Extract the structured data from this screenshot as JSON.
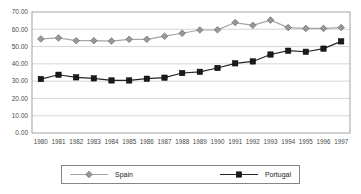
{
  "chart_data": {
    "type": "line",
    "title": "",
    "xlabel": "",
    "ylabel": "",
    "x": [
      "1980",
      "1981",
      "1982",
      "1983",
      "1984",
      "1985",
      "1986",
      "1987",
      "1988",
      "1989",
      "1990",
      "1991",
      "1992",
      "1993",
      "1994",
      "1995",
      "1996",
      "1997"
    ],
    "series": [
      {
        "name": "Spain",
        "marker": "diamond",
        "color": "#999999",
        "line_color": "#a6a6a6",
        "marker_edge_color": "#6b6b6b",
        "values": [
          54.4,
          55.0,
          53.4,
          53.4,
          53.2,
          54.2,
          54.2,
          56.0,
          57.7,
          59.6,
          59.7,
          63.9,
          62.3,
          65.3,
          61.0,
          60.5,
          60.5,
          61.0
        ]
      },
      {
        "name": "Portugal",
        "marker": "square",
        "color": "#1a1a1a",
        "line_color": "#262626",
        "marker_edge_color": "#000000",
        "values": [
          31.2,
          33.7,
          32.2,
          31.6,
          30.4,
          30.4,
          31.4,
          32.0,
          34.7,
          35.4,
          37.6,
          40.3,
          41.4,
          45.4,
          47.6,
          47.0,
          48.8,
          53.0
        ]
      }
    ],
    "ylim": [
      0,
      70
    ],
    "ytick_step": 10,
    "ytick_labels": [
      "0.00",
      "10.00",
      "20.00",
      "30.00",
      "40.00",
      "50.00",
      "60.00",
      "70.00"
    ],
    "grid": "horizontal",
    "gridline_color": "#cccccc",
    "plot_border_color": "#8c8c8c",
    "tick_label_color": "#4a4a4a",
    "legend_position": "bottom"
  }
}
